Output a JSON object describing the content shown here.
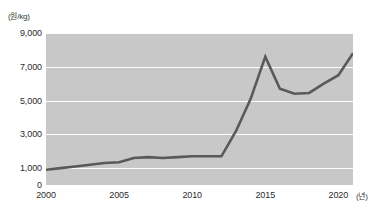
{
  "chart_data": {
    "type": "line",
    "title": "",
    "subtitle": "",
    "xlabel": "(년)",
    "ylabel": "(원/kg)",
    "x": [
      2000,
      2001,
      2002,
      2003,
      2004,
      2005,
      2006,
      2007,
      2008,
      2009,
      2010,
      2011,
      2012,
      2013,
      2014,
      2015,
      2016,
      2017,
      2018,
      2019,
      2020,
      2021
    ],
    "values": [
      900,
      1000,
      1100,
      1200,
      1300,
      1350,
      1600,
      1650,
      1600,
      1650,
      1700,
      1700,
      1700,
      3200,
      5100,
      7600,
      5700,
      5400,
      5450,
      6000,
      6500,
      7800
    ],
    "series": [
      {
        "name": "가격",
        "values": [
          900,
          1000,
          1100,
          1200,
          1300,
          1350,
          1600,
          1650,
          1600,
          1650,
          1700,
          1700,
          1700,
          3200,
          5100,
          7600,
          5700,
          5400,
          5450,
          6000,
          6500,
          7800
        ]
      }
    ],
    "y_ticks": [
      "0",
      "1,000",
      "3,000",
      "5,000",
      "7,000",
      "9,000"
    ],
    "y_tick_values": [
      0,
      1000,
      3000,
      5000,
      7000,
      9000
    ],
    "x_ticks": [
      "2000",
      "2005",
      "2010",
      "2015",
      "2020"
    ],
    "x_tick_values": [
      2000,
      2005,
      2010,
      2015,
      2020
    ],
    "ylim": [
      0,
      9000
    ],
    "xlim": [
      2000,
      2021
    ],
    "grid": true,
    "legend": false,
    "legend_position": "none",
    "colors": {
      "line": "#595959",
      "plot_background": "#c8c8c8",
      "gridline": "#fdfdfd",
      "text": "#2b2b2b"
    }
  },
  "axis": {
    "y_unit": "(원/kg)",
    "x_unit": "(년)"
  }
}
